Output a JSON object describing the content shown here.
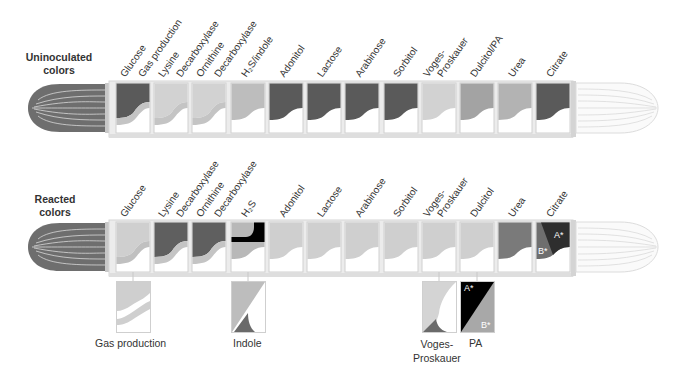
{
  "rows": [
    {
      "title_line1": "Uninoculated",
      "title_line2": "colors",
      "labels": [
        "Glucose",
        "Gas production",
        "Lysine",
        "Decarboxylase",
        "Ornithine",
        "Decarboxylase",
        "H₂S/indole",
        "Adonitol",
        "Lactose",
        "Arabinose",
        "Sorbitol",
        "Voges-",
        "Proskauer",
        "Dulcitol/PA",
        "Urea",
        "Citrate"
      ],
      "compartments": [
        {
          "name": "Glucose",
          "top": "#5a5a5a",
          "band": "#c4c4c4"
        },
        {
          "name": "Lysine Decarboxylase",
          "top": "#d2d2d2",
          "band": "#c4c4c4"
        },
        {
          "name": "Ornithine Decarboxylase",
          "top": "#d2d2d2",
          "band": "#c4c4c4"
        },
        {
          "name": "H2S/indole",
          "top": "#bdbdbd",
          "band": null
        },
        {
          "name": "Adonitol",
          "top": "#5a5a5a",
          "band": null
        },
        {
          "name": "Lactose",
          "top": "#5a5a5a",
          "band": null
        },
        {
          "name": "Arabinose",
          "top": "#5a5a5a",
          "band": null
        },
        {
          "name": "Sorbitol",
          "top": "#5a5a5a",
          "band": null
        },
        {
          "name": "Voges-Proskauer",
          "top": "#d2d2d2",
          "band": null
        },
        {
          "name": "Dulcitol/PA",
          "top": "#a3a3a3",
          "band": null
        },
        {
          "name": "Urea",
          "top": "#b3b3b3",
          "band": null
        },
        {
          "name": "Citrate",
          "top": "#5a5a5a",
          "band": null
        }
      ]
    },
    {
      "title_line1": "Reacted",
      "title_line2": "colors",
      "labels": [
        "Glucose",
        "Lysine",
        "Decarboxylase",
        "Ornithine",
        "Decarboxylase",
        "H₂S",
        "Adonitol",
        "Lactose",
        "Arabinose",
        "Sorbitol",
        "Voges-",
        "Proskauer",
        "Dulcitol",
        "Urea",
        "Citrate"
      ],
      "compartments": [
        {
          "name": "Glucose",
          "top": "#cfcfcf",
          "band": "#c0c0c0"
        },
        {
          "name": "Lysine Decarboxylase",
          "top": "#5f5f5f",
          "band": "#c4c4c4"
        },
        {
          "name": "Ornithine Decarboxylase",
          "top": "#5f5f5f",
          "band": "#c4c4c4"
        },
        {
          "name": "H2S",
          "top": "#b8b8b8",
          "band": null,
          "black_corner": true
        },
        {
          "name": "Adonitol",
          "top": "#cfcfcf",
          "band": null
        },
        {
          "name": "Lactose",
          "top": "#cfcfcf",
          "band": null
        },
        {
          "name": "Arabinose",
          "top": "#cfcfcf",
          "band": null
        },
        {
          "name": "Sorbitol",
          "top": "#cfcfcf",
          "band": null
        },
        {
          "name": "Voges-Proskauer",
          "top": "#cfcfcf",
          "band": null
        },
        {
          "name": "Dulcitol",
          "top": "#cfcfcf",
          "band": null
        },
        {
          "name": "Urea",
          "top": "#7a7a7a",
          "band": null
        },
        {
          "name": "Citrate",
          "top": "#3a3a3a",
          "band": null,
          "split": true
        }
      ],
      "citrate_marks": {
        "a": "A*",
        "b": "B*"
      }
    }
  ],
  "detail_panels": [
    {
      "label": "Gas production"
    },
    {
      "label": "Indole"
    },
    {
      "label_line1": "Voges-",
      "label_line2": "Proskauer"
    },
    {
      "label": "PA",
      "mark_a": "A*",
      "mark_b": "B*"
    }
  ],
  "colors": {
    "tube_frame": "#dcdcdc",
    "cap_dark": "#6e6e6e",
    "cap_light": "#f2f2f2",
    "black": "#000000"
  }
}
